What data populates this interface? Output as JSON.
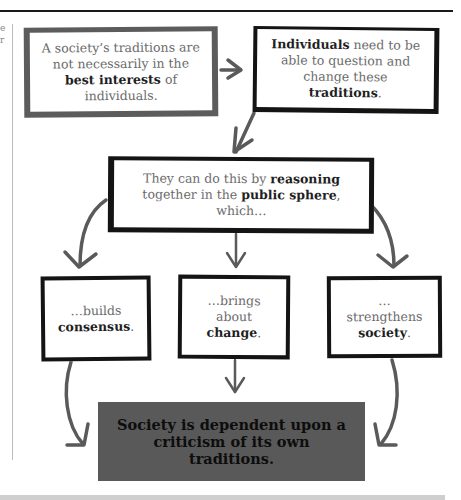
{
  "page": {
    "margin_fragment": "e\nr"
  },
  "diagram": {
    "boxes": [
      {
        "id": "traditions-not-best-interests",
        "parts": [
          {
            "text": "A society’s traditions are not necessarily in the ",
            "bold": false
          },
          {
            "text": "best interests",
            "bold": true
          },
          {
            "text": " of individuals.",
            "bold": false
          }
        ]
      },
      {
        "id": "individuals-question-traditions",
        "parts": [
          {
            "text": "Individuals",
            "bold": true
          },
          {
            "text": " need to be able to question and change these ",
            "bold": false
          },
          {
            "text": "traditions",
            "bold": true
          },
          {
            "text": ".",
            "bold": false
          }
        ]
      },
      {
        "id": "reasoning-public-sphere",
        "parts": [
          {
            "text": "They can do this by ",
            "bold": false
          },
          {
            "text": "reasoning",
            "bold": true
          },
          {
            "text": " together in the ",
            "bold": false
          },
          {
            "text": "public sphere",
            "bold": true
          },
          {
            "text": ", which…",
            "bold": false
          }
        ]
      },
      {
        "id": "builds-consensus",
        "parts": [
          {
            "text": "…builds ",
            "bold": false
          },
          {
            "text": "consensus",
            "bold": true
          },
          {
            "text": ".",
            "bold": false
          }
        ]
      },
      {
        "id": "brings-about-change",
        "parts": [
          {
            "text": "…brings about ",
            "bold": false
          },
          {
            "text": "change",
            "bold": true
          },
          {
            "text": ".",
            "bold": false
          }
        ]
      },
      {
        "id": "strengthens-society",
        "parts": [
          {
            "text": "…strengthens ",
            "bold": false
          },
          {
            "text": "society",
            "bold": true
          },
          {
            "text": ".",
            "bold": false
          }
        ]
      }
    ],
    "conclusion": "Society is dependent upon a criticism of its own traditions.",
    "edges": [
      {
        "from": "traditions-not-best-interests",
        "to": "individuals-question-traditions"
      },
      {
        "from": "individuals-question-traditions",
        "to": "reasoning-public-sphere"
      },
      {
        "from": "reasoning-public-sphere",
        "to": "builds-consensus"
      },
      {
        "from": "reasoning-public-sphere",
        "to": "brings-about-change"
      },
      {
        "from": "reasoning-public-sphere",
        "to": "strengthens-society"
      },
      {
        "from": "builds-consensus",
        "to": "conclusion"
      },
      {
        "from": "brings-about-change",
        "to": "conclusion"
      },
      {
        "from": "strengthens-society",
        "to": "conclusion"
      }
    ],
    "colors": {
      "grey_border": "#5c5c5c",
      "black_border": "#141414",
      "arrow": "#5a5a5a",
      "conclusion_fill": "#595959",
      "body_text": "#6b6b6b",
      "bold_text": "#1f1f1f"
    }
  }
}
